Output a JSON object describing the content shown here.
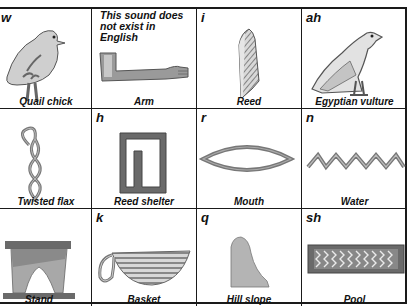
{
  "cells": [
    {
      "sound": "w",
      "label": "Quail chick",
      "icon": "quail-chick-icon"
    },
    {
      "sound": "",
      "note_line1": "This sound does",
      "note_line2": "not exist in English",
      "label": "Arm",
      "icon": "arm-icon"
    },
    {
      "sound": "i",
      "label": "Reed",
      "icon": "reed-icon"
    },
    {
      "sound": "ah",
      "label": "Egyptian vulture",
      "icon": "vulture-icon"
    },
    {
      "sound": "",
      "label": "Twisted flax",
      "icon": "twisted-flax-icon"
    },
    {
      "sound": "h",
      "label": "Reed shelter",
      "icon": "reed-shelter-icon"
    },
    {
      "sound": "r",
      "label": "Mouth",
      "icon": "mouth-icon"
    },
    {
      "sound": "n",
      "label": "Water",
      "icon": "water-icon"
    },
    {
      "sound": "",
      "label": "Stand",
      "icon": "stand-icon"
    },
    {
      "sound": "k",
      "label": "Basket",
      "icon": "basket-icon"
    },
    {
      "sound": "q",
      "label": "Hill slope",
      "icon": "hill-slope-icon"
    },
    {
      "sound": "sh",
      "label": "Pool",
      "icon": "pool-icon"
    }
  ],
  "colors": {
    "line": "#1a1a1a",
    "glyph_fill": "#c8c8c8",
    "glyph_dark": "#6a6a6a"
  }
}
